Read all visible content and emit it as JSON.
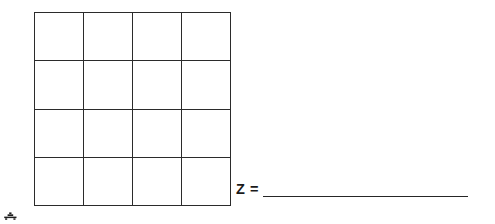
{
  "page": {
    "background_color": "#ffffff",
    "width": 495,
    "height": 224
  },
  "grid": {
    "name": "blank-4x4-answer-grid",
    "rows": 4,
    "columns": 4,
    "line_color": "#2b2b2b",
    "cell_fill": "#ffffff",
    "cells": [
      [
        "",
        "",
        "",
        ""
      ],
      [
        "",
        "",
        "",
        ""
      ],
      [
        "",
        "",
        "",
        ""
      ],
      [
        "",
        "",
        "",
        ""
      ]
    ]
  },
  "answer": {
    "label": "Z =",
    "value": "",
    "blank_line_color": "#262626"
  },
  "artifact": {
    "name": "corner-mark",
    "description": "small cropped dark mark",
    "color": "#1f1f1f"
  }
}
